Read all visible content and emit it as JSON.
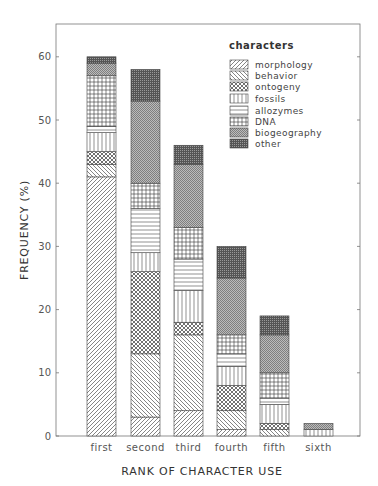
{
  "chart_data": {
    "type": "bar",
    "stacked": true,
    "title": "",
    "xlabel": "RANK OF CHARACTER USE",
    "ylabel": "FREQUENCY (%)",
    "ylim": [
      0,
      65
    ],
    "yticks": [
      0,
      10,
      20,
      30,
      40,
      50,
      60
    ],
    "grid": false,
    "legend_position": "top-right inside",
    "legend_title": "characters",
    "categories": [
      "first",
      "second",
      "third",
      "fourth",
      "fifth",
      "sixth"
    ],
    "series": [
      {
        "name": "morphology",
        "pattern": "diagonal-forward",
        "values": [
          41,
          3,
          4,
          1,
          0,
          0
        ]
      },
      {
        "name": "behavior",
        "pattern": "diagonal-backward",
        "values": [
          2,
          10,
          12,
          3,
          1,
          0
        ]
      },
      {
        "name": "ontogeny",
        "pattern": "crosshatch-diagonal",
        "values": [
          2,
          13,
          2,
          4,
          1,
          0
        ]
      },
      {
        "name": "fossils",
        "pattern": "vertical-lines",
        "values": [
          3,
          3,
          5,
          3,
          3,
          1
        ]
      },
      {
        "name": "allozymes",
        "pattern": "horizontal-lines",
        "values": [
          1,
          7,
          5,
          2,
          1,
          0
        ]
      },
      {
        "name": "DNA",
        "pattern": "grid",
        "values": [
          8,
          4,
          5,
          3,
          4,
          0
        ]
      },
      {
        "name": "biogeography",
        "pattern": "dense-diagonal-gray",
        "values": [
          2,
          13,
          10,
          9,
          6,
          1
        ]
      },
      {
        "name": "other",
        "pattern": "dark-stipple",
        "values": [
          1,
          5,
          3,
          5,
          3,
          0
        ]
      }
    ],
    "totals": [
      60,
      58,
      46,
      30,
      19,
      2
    ]
  }
}
